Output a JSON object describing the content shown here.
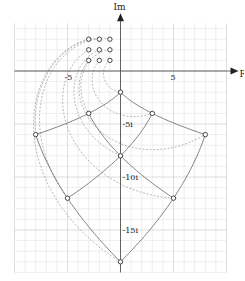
{
  "diagram": {
    "axes": {
      "x_label": "Re",
      "y_label": "Im",
      "ticks_x": [
        {
          "value": -5,
          "label": "-5"
        },
        {
          "value": 5,
          "label": "5"
        }
      ],
      "ticks_y": [
        {
          "value": -5,
          "label": "-5i"
        },
        {
          "value": -10,
          "label": "-10i"
        },
        {
          "value": -15,
          "label": "-15i"
        }
      ],
      "range_x": [
        -10,
        10
      ],
      "range_y": [
        -19,
        4.5
      ],
      "grid": true,
      "minor_step": 1,
      "major_step": 5
    },
    "source_points": [
      {
        "z": "-3+3i"
      },
      {
        "z": "-2+3i"
      },
      {
        "z": "-1+3i"
      },
      {
        "z": "-3+2i"
      },
      {
        "z": "-2+2i"
      },
      {
        "z": "-1+2i"
      },
      {
        "z": "-3+1i"
      },
      {
        "z": "-2+1i"
      },
      {
        "z": "-1+1i"
      }
    ],
    "image_points": [
      {
        "w": "0-18i"
      },
      {
        "w": "-5-12i"
      },
      {
        "w": "-8-6i"
      },
      {
        "w": "5-12i"
      },
      {
        "w": "0-8i"
      },
      {
        "w": "-3-4i"
      },
      {
        "w": "8-6i"
      },
      {
        "w": "3-4i"
      },
      {
        "w": "0-2i"
      }
    ],
    "colors": {
      "grid_minor": "#e2e2e2",
      "grid_major": "#c8c8c8",
      "axis": "#555555",
      "curve": "#666666",
      "dashed": "#999999",
      "point": "#444444"
    }
  }
}
